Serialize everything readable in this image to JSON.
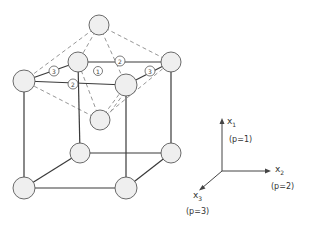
{
  "diagram": {
    "type": "crystal-lattice",
    "site_labels": [
      {
        "id": "site-3-left",
        "label": "3"
      },
      {
        "id": "site-2-top",
        "label": "2"
      },
      {
        "id": "site-1-center",
        "label": "1"
      },
      {
        "id": "site-3-right",
        "label": "3"
      },
      {
        "id": "site-2-front",
        "label": "2"
      }
    ],
    "axes": {
      "x1": {
        "name": "x",
        "sub": "1",
        "note": "(p=1)"
      },
      "x2": {
        "name": "x",
        "sub": "2",
        "note": "(p=2)"
      },
      "x3": {
        "name": "x",
        "sub": "3",
        "note": "(p=3)"
      }
    },
    "colors": {
      "line": "#3a3a3a",
      "dash": "#8a8a8a",
      "atom_fill": "#efefef"
    }
  }
}
